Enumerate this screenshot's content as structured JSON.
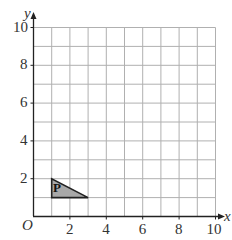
{
  "diagram": {
    "type": "coordinate-grid",
    "x_axis": {
      "label": "x",
      "min": 0,
      "max": 10,
      "tick_labels": [
        "2",
        "4",
        "6",
        "8",
        "10"
      ]
    },
    "y_axis": {
      "label": "y",
      "min": 0,
      "max": 10,
      "tick_labels": [
        "2",
        "4",
        "6",
        "8",
        "10"
      ]
    },
    "origin_label": "O",
    "grid": {
      "step": 1,
      "color": "#b0b0b0"
    },
    "shapes": [
      {
        "name": "P",
        "label": "P",
        "kind": "triangle",
        "vertices": [
          [
            1,
            2
          ],
          [
            1,
            1
          ],
          [
            3,
            1
          ]
        ],
        "fill": "#a8a8a8",
        "stroke": "#222222"
      }
    ],
    "colors": {
      "axis": "#222222",
      "grid": "#b0b0b0",
      "text": "#333333",
      "shape_fill": "#a8a8a8"
    }
  },
  "chart_data": {
    "type": "scatter",
    "title": "",
    "xlabel": "x",
    "ylabel": "y",
    "xlim": [
      0,
      10
    ],
    "ylim": [
      0,
      10
    ],
    "grid": true,
    "x_ticks": [
      2,
      4,
      6,
      8,
      10
    ],
    "y_ticks": [
      2,
      4,
      6,
      8,
      10
    ],
    "series": [
      {
        "name": "P",
        "shape": "triangle",
        "points": [
          [
            1,
            2
          ],
          [
            1,
            1
          ],
          [
            3,
            1
          ]
        ]
      }
    ]
  }
}
